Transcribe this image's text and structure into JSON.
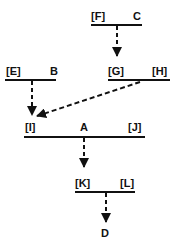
{
  "diagram": {
    "type": "derivation-tree",
    "line_color": "#111111",
    "nodes": [
      {
        "id": "C",
        "labels": [
          "[F]",
          "C"
        ]
      },
      {
        "id": "H-level",
        "labels": [
          "[G]",
          "[H]"
        ]
      },
      {
        "id": "B",
        "labels": [
          "[E]",
          "B"
        ]
      },
      {
        "id": "A",
        "labels": [
          "[I]",
          "A",
          "[J]"
        ]
      },
      {
        "id": "L-level",
        "labels": [
          "[K]",
          "[L]"
        ]
      },
      {
        "id": "D",
        "labels": [
          "D"
        ]
      }
    ],
    "edges": [
      {
        "from": "C bar",
        "to": "[G]",
        "style": "dashed-arrow"
      },
      {
        "from": "B bar",
        "to": "[I]",
        "style": "dashed-arrow"
      },
      {
        "from": "[G] [H] bar",
        "to": "[I]",
        "style": "dashed-arrow"
      },
      {
        "from": "A bar",
        "to": "[K]",
        "style": "dashed-arrow"
      },
      {
        "from": "[K] [L] bar",
        "to": "D",
        "style": "dashed-arrow"
      }
    ]
  },
  "labels": {
    "F": "[F]",
    "C": "C",
    "G": "[G]",
    "H": "[H]",
    "E": "[E]",
    "B": "B",
    "I": "[I]",
    "A": "A",
    "J": "[J]",
    "K": "[K]",
    "L": "[L]",
    "D": "D"
  }
}
